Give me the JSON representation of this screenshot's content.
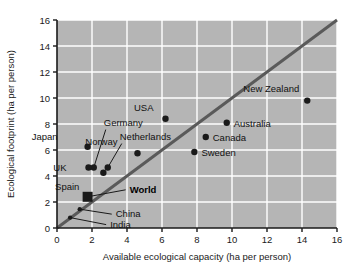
{
  "chart_data": {
    "type": "scatter",
    "title": "",
    "xlabel": "Available ecological capacity (ha per person)",
    "ylabel": "Ecological footprint (ha per person)",
    "xlim": [
      0,
      16
    ],
    "ylim": [
      0,
      16
    ],
    "xticks": [
      0,
      2,
      4,
      6,
      8,
      10,
      12,
      14,
      16
    ],
    "yticks": [
      0,
      2,
      4,
      6,
      8,
      10,
      12,
      14,
      16
    ],
    "xtick_labels": [
      "0",
      "2",
      "4",
      "6",
      "8",
      "10",
      "12",
      "14",
      "16"
    ],
    "ytick_labels": [
      "0",
      "2",
      "4",
      "6",
      "8",
      "10",
      "12",
      "14",
      "16"
    ],
    "grid": true,
    "grid_color": "#ffffff",
    "plot_background": "#b5b5b5",
    "marker_color": "#1a1a1a",
    "reference_line": {
      "label": "",
      "from": [
        0,
        0
      ],
      "to": [
        16,
        16
      ],
      "color": "#5a5a5a",
      "width": 3
    },
    "points": [
      {
        "name": "Japan",
        "x": 1.75,
        "y": 6.25,
        "label_dx": -30,
        "label_dy": -7,
        "marker": "circle",
        "bold": false,
        "leader": false
      },
      {
        "name": "Germany",
        "x": 2.1,
        "y": 4.65,
        "label_dx": 10,
        "label_dy": -42,
        "marker": "circle",
        "bold": false,
        "leader": true
      },
      {
        "name": "Netherlands",
        "x": 2.9,
        "y": 4.65,
        "label_dx": 12,
        "label_dy": -28,
        "marker": "circle",
        "bold": false,
        "leader": true
      },
      {
        "name": "UK",
        "x": 1.8,
        "y": 4.65,
        "label_dx": -22,
        "label_dy": 3,
        "marker": "circle",
        "bold": false,
        "leader": false
      },
      {
        "name": "Spain",
        "x": 2.65,
        "y": 4.25,
        "label_dx": -24,
        "label_dy": 17,
        "marker": "circle",
        "bold": false,
        "leader": false
      },
      {
        "name": "Norway",
        "x": 4.6,
        "y": 5.75,
        "label_dx": -20,
        "label_dy": -8,
        "marker": "circle",
        "bold": false,
        "leader": false
      },
      {
        "name": "USA",
        "x": 6.2,
        "y": 8.4,
        "label_dx": -12,
        "label_dy": -8,
        "marker": "circle",
        "bold": false,
        "leader": false
      },
      {
        "name": "Sweden",
        "x": 7.85,
        "y": 5.85,
        "label_dx": 7,
        "label_dy": 4,
        "marker": "circle",
        "bold": false,
        "leader": false
      },
      {
        "name": "Canada",
        "x": 8.5,
        "y": 7.0,
        "label_dx": 7,
        "label_dy": 4,
        "marker": "circle",
        "bold": false,
        "leader": false
      },
      {
        "name": "Australia",
        "x": 9.7,
        "y": 8.1,
        "label_dx": 7,
        "label_dy": 4,
        "marker": "circle",
        "bold": false,
        "leader": false
      },
      {
        "name": "New Zealand",
        "x": 14.3,
        "y": 9.8,
        "label_dx": -8,
        "label_dy": -9,
        "marker": "circle",
        "bold": false,
        "leader": false
      },
      {
        "name": "World",
        "x": 1.75,
        "y": 2.4,
        "label_dx": 42,
        "label_dy": -4,
        "marker": "square",
        "bold": true,
        "leader": true
      },
      {
        "name": "China",
        "x": 1.3,
        "y": 1.45,
        "label_dx": 36,
        "label_dy": 8,
        "marker": "small",
        "bold": false,
        "leader": true
      },
      {
        "name": "India",
        "x": 0.75,
        "y": 0.8,
        "label_dx": 40,
        "label_dy": 10,
        "marker": "small",
        "bold": false,
        "leader": true
      }
    ]
  }
}
